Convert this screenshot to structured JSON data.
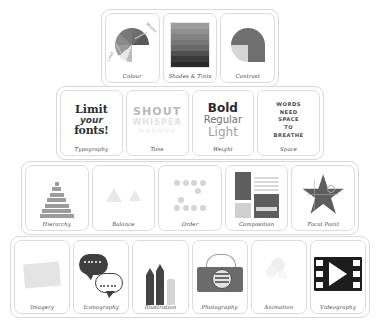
{
  "diagram": {
    "background_color": "#ffffff",
    "outline_color": "#d8d8d8",
    "rows": [
      {
        "name": "colour-row",
        "cards": [
          {
            "caption": "Colour",
            "art": "colour-wheel",
            "annotations": [
              "Warm",
              "Cool"
            ]
          },
          {
            "caption": "Shades & Tints",
            "art": "grayscale-gradient-bands",
            "bands": [
              "#9c9c9c",
              "#8f8f8f",
              "#828282",
              "#767676",
              "#6a6a6a",
              "#4f4f4f",
              "#3a3a3a",
              "#2b2b2b"
            ]
          },
          {
            "caption": "Contrast",
            "art": "contrast-circle"
          }
        ]
      },
      {
        "name": "typography-row",
        "cards": [
          {
            "caption": "Typography",
            "art": "limit-your-fonts-text",
            "lines": [
              "Limit",
              "your",
              "fonts!"
            ]
          },
          {
            "caption": "Tone",
            "art": "fading-tone-text",
            "lines": [
              "SHOUT",
              "WHISPER",
              "MURMUR"
            ]
          },
          {
            "caption": "Weight",
            "art": "font-weight-text",
            "lines": [
              "Bold",
              "Regular",
              "Light"
            ]
          },
          {
            "caption": "Space",
            "art": "words-need-space-text",
            "lines": [
              "WORDS",
              "NEED",
              "SPACE",
              "TO",
              "BREATHE"
            ]
          }
        ]
      },
      {
        "name": "layout-row",
        "cards": [
          {
            "caption": "Hierarchy",
            "art": "stacked-pyramid"
          },
          {
            "caption": "Balance",
            "art": "two-triangles"
          },
          {
            "caption": "Order",
            "art": "dot-grid"
          },
          {
            "caption": "Composition",
            "art": "layout-blocks"
          },
          {
            "caption": "Focal Point",
            "art": "star-shape"
          }
        ]
      },
      {
        "name": "media-row",
        "cards": [
          {
            "caption": "Imagery",
            "art": "photo-rectangle"
          },
          {
            "caption": "Iconography",
            "art": "speech-bubbles"
          },
          {
            "caption": "Illustration",
            "art": "pencils"
          },
          {
            "caption": "Photography",
            "art": "camera"
          },
          {
            "caption": "Animation",
            "art": "motion-circles"
          },
          {
            "caption": "Videography",
            "art": "film-play"
          }
        ]
      }
    ]
  }
}
